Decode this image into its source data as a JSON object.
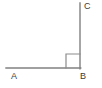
{
  "figure": {
    "background_color": "#ffffff",
    "stroke_color": "#808080",
    "label_color": "#3b3b3b",
    "stroke_width": 1.4,
    "width": 102,
    "height": 88,
    "labels": {
      "a": "A",
      "b": "B",
      "c": "C"
    },
    "points": {
      "A": {
        "x": 6,
        "y": 68
      },
      "B": {
        "x": 80,
        "y": 68
      },
      "C": {
        "x": 80,
        "y": 3
      }
    },
    "segments": [
      {
        "name": "segment-AB",
        "x1": 6,
        "y1": 68,
        "x2": 80,
        "y2": 68
      },
      {
        "name": "segment-BC",
        "x1": 80,
        "y1": 68,
        "x2": 80,
        "y2": 3
      }
    ],
    "right_angle_marker": {
      "name": "right-angle-square",
      "vertex": "B",
      "size": 14,
      "x": 66,
      "y": 54
    }
  }
}
